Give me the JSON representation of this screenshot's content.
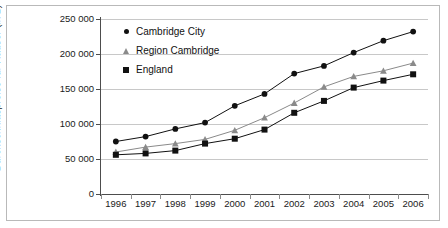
{
  "chart_data": {
    "type": "line",
    "title": "",
    "xlabel": "",
    "ylabel": "Durchschnittspreise für Häuser (in £)",
    "x": [
      1996,
      1997,
      1998,
      1999,
      2000,
      2001,
      2002,
      2003,
      2004,
      2005,
      2006
    ],
    "categories": [
      "1996",
      "1997",
      "1998",
      "1999",
      "2000",
      "2001",
      "2002",
      "2003",
      "2004",
      "2005",
      "2006"
    ],
    "ylim": [
      0,
      250000
    ],
    "ytick_labels": [
      "250 000",
      "200 000",
      "150 000",
      "100 000",
      "50 000",
      "0"
    ],
    "ytick_values": [
      250000,
      200000,
      150000,
      100000,
      50000,
      0
    ],
    "grid": "horizontal",
    "legend_position": "top-left-inside",
    "series": [
      {
        "name": "Cambridge City",
        "marker": "circle",
        "color": "#111111",
        "values": [
          75000,
          82000,
          93000,
          102000,
          126000,
          143000,
          172000,
          183000,
          202000,
          219000,
          232000
        ]
      },
      {
        "name": "Region Cambridge",
        "marker": "triangle",
        "color": "#8a8a8a",
        "values": [
          60000,
          67000,
          72000,
          78000,
          91000,
          109000,
          130000,
          153000,
          168000,
          176000,
          187000
        ]
      },
      {
        "name": "England",
        "marker": "square",
        "color": "#111111",
        "values": [
          56000,
          58000,
          62000,
          72000,
          79000,
          92000,
          116000,
          133000,
          152000,
          162000,
          171000
        ]
      }
    ]
  },
  "legend": {
    "items": [
      {
        "label": "Cambridge City",
        "marker": "circle-marker-icon"
      },
      {
        "label": "Region Cambridge",
        "marker": "triangle-marker-icon"
      },
      {
        "label": "England",
        "marker": "square-marker-icon"
      }
    ]
  },
  "colors": {
    "dark": "#111111",
    "gray": "#8a8a8a",
    "grid": "#c8c8c8",
    "axis": "#4d4d4d",
    "border": "#b9b9b9",
    "background": "#ffffff"
  }
}
